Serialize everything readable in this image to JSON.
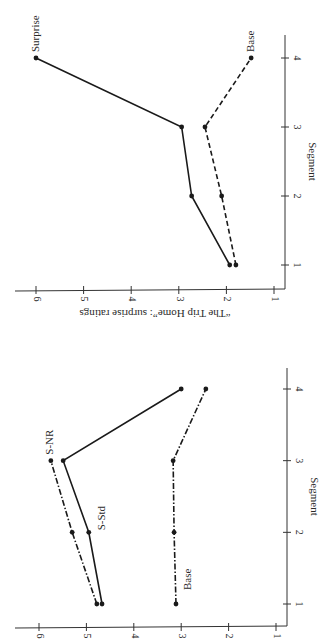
{
  "chart_data": [
    {
      "type": "line",
      "title": "",
      "orientation": "rotated 90° clockwise",
      "xlabel": "Segment",
      "ylabel": "“The Trip Home”:  surprise ratings",
      "x": [
        1,
        2,
        3,
        4
      ],
      "x_tick_labels": [
        "1",
        "2",
        "3",
        "4"
      ],
      "ylim": [
        1,
        6
      ],
      "y_tick_labels": [
        "1",
        "2",
        "3",
        "4",
        "5",
        "6"
      ],
      "grid": false,
      "series": [
        {
          "name": "Surprise",
          "style": "solid",
          "values": [
            1.93,
            2.73,
            2.94,
            6.0
          ]
        },
        {
          "name": "Base",
          "style": "dashed",
          "values": [
            1.8,
            2.1,
            2.45,
            1.48
          ]
        }
      ]
    },
    {
      "type": "line",
      "title": "",
      "orientation": "rotated 90° clockwise",
      "xlabel": "Segment",
      "ylabel": "",
      "x": [
        1,
        2,
        3,
        4
      ],
      "x_tick_labels": [
        "1",
        "2",
        "3",
        "4"
      ],
      "ylim": [
        1,
        6
      ],
      "y_tick_labels": [
        "1",
        "2",
        "3",
        "4",
        "5",
        "6"
      ],
      "grid": false,
      "series": [
        {
          "name": "S-Std",
          "style": "solid",
          "values": [
            4.67,
            4.95,
            5.49,
            3.0
          ]
        },
        {
          "name": "S-NR",
          "style": "dashdot",
          "values": [
            4.78,
            5.3,
            5.75,
            null
          ]
        },
        {
          "name": "Base",
          "style": "dashdot",
          "values": [
            3.11,
            3.15,
            3.17,
            2.48
          ]
        }
      ]
    }
  ]
}
